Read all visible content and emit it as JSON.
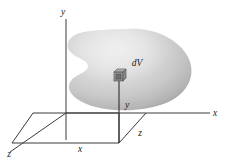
{
  "figure": {
    "caption": "",
    "background_color": "#ffffff",
    "line_color": "#3a3a3a",
    "blob_fill_light": "#e2e2e2",
    "blob_fill_mid": "#cfcfcf",
    "blob_fill_dark": "#a9a9a9",
    "axes": {
      "y_axis_label": "y",
      "x_axis_label": "x",
      "z_axis_label": "z"
    },
    "labels": {
      "y_axis_top": "y",
      "x_axis_right": "x",
      "z_axis_front_left": "z",
      "coord_x": "x",
      "coord_y": "y",
      "coord_z": "z",
      "volume_element": "dV"
    },
    "elements": {
      "volume_element_name": "dV",
      "region_name": "volume region"
    }
  }
}
